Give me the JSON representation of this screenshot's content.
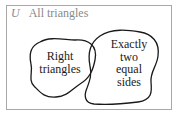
{
  "diagram": {
    "type": "venn",
    "universe": {
      "symbol": "U",
      "label": "All triangles"
    },
    "sets": [
      {
        "id": "right-triangles",
        "label_lines": [
          "Right",
          "triangles"
        ]
      },
      {
        "id": "exactly-two-equal-sides",
        "label_lines": [
          "Exactly",
          "two",
          "equal",
          "sides"
        ]
      }
    ],
    "relationship": "overlapping",
    "colors": {
      "universe_border": "#a8a8a8",
      "universe_label": "#8a8a8a",
      "set_outline": "#1a1a1a",
      "set_text": "#1a1a1a"
    }
  }
}
